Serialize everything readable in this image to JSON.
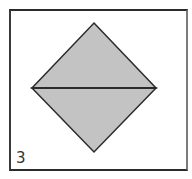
{
  "figure": {
    "label": "3",
    "shape": "diamond-split-horizontal",
    "vertices": {
      "top": [
        94,
        23
      ],
      "left": [
        32,
        88
      ],
      "right": [
        156,
        88
      ],
      "bottom": [
        94,
        152
      ]
    },
    "colors": {
      "fill": "#c3c3c3",
      "stroke": "#2b2b2b",
      "frame": "#2b2b2b",
      "background": "#ffffff"
    }
  }
}
